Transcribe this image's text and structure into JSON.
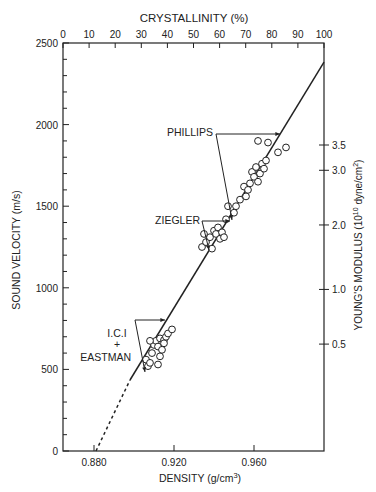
{
  "chart_data": {
    "type": "scatter",
    "title": "",
    "top_axis": {
      "label": "CRYSTALLINITY (%)",
      "ticks": [
        0,
        10,
        20,
        30,
        40,
        50,
        60,
        70,
        80,
        90,
        100
      ],
      "range": [
        0,
        100
      ]
    },
    "xlabel": "DENSITY (g/cm3)",
    "xlabel_main": "DENSITY (g/cm",
    "xlabel_sup": "3",
    "xlabel_end": ")",
    "xticks": [
      "0.880",
      "0.920",
      "0.960"
    ],
    "xlim": [
      0.8645,
      0.995
    ],
    "ylabel": "SOUND VELOCITY (m/s)",
    "yticks": [
      "0",
      "500",
      "1000",
      "1500",
      "2000",
      "2500"
    ],
    "ylim": [
      0,
      2500
    ],
    "right_axis": {
      "label": "YOUNG'S MODULUS (10^10 dyne/cm2)",
      "label_pre": "YOUNG'S MODULUS (10",
      "label_sup1": "10",
      "label_mid": " dyne/cm",
      "label_sup2": "2",
      "label_end": ")",
      "ticks": [
        {
          "label": "0.5",
          "velocity": 655
        },
        {
          "label": "1.0",
          "velocity": 990
        },
        {
          "label": "2.0",
          "velocity": 1385
        },
        {
          "label": "3.0",
          "velocity": 1720
        },
        {
          "label": "3.5",
          "velocity": 1875
        }
      ]
    },
    "grid": false,
    "fit_line": {
      "dashed": [
        [
          0.881,
          0
        ],
        [
          0.898,
          435
        ]
      ],
      "solid": [
        [
          0.898,
          435
        ],
        [
          0.995,
          2383
        ]
      ]
    },
    "series": [
      {
        "name": "I.C.I + EASTMAN",
        "points": [
          [
            0.906,
            560
          ],
          [
            0.907,
            520
          ],
          [
            0.908,
            540
          ],
          [
            0.909,
            600
          ],
          [
            0.91,
            650
          ],
          [
            0.911,
            675
          ],
          [
            0.912,
            640
          ],
          [
            0.913,
            690
          ],
          [
            0.913,
            580
          ],
          [
            0.914,
            620
          ],
          [
            0.915,
            680
          ],
          [
            0.915,
            660
          ],
          [
            0.916,
            700
          ],
          [
            0.917,
            720
          ],
          [
            0.919,
            745
          ],
          [
            0.912,
            530
          ],
          [
            0.908,
            675
          ]
        ]
      },
      {
        "name": "ZIEGLER",
        "points": [
          [
            0.934,
            1250
          ],
          [
            0.936,
            1280
          ],
          [
            0.938,
            1310
          ],
          [
            0.939,
            1240
          ],
          [
            0.94,
            1350
          ],
          [
            0.941,
            1330
          ],
          [
            0.942,
            1370
          ],
          [
            0.943,
            1300
          ],
          [
            0.944,
            1340
          ],
          [
            0.945,
            1310
          ],
          [
            0.946,
            1420
          ],
          [
            0.935,
            1330
          ]
        ]
      },
      {
        "name": "PHILLIPS",
        "points": [
          [
            0.95,
            1460
          ],
          [
            0.951,
            1500
          ],
          [
            0.953,
            1540
          ],
          [
            0.955,
            1620
          ],
          [
            0.956,
            1560
          ],
          [
            0.957,
            1600
          ],
          [
            0.958,
            1640
          ],
          [
            0.959,
            1710
          ],
          [
            0.96,
            1680
          ],
          [
            0.961,
            1740
          ],
          [
            0.962,
            1650
          ],
          [
            0.963,
            1700
          ],
          [
            0.964,
            1760
          ],
          [
            0.965,
            1730
          ],
          [
            0.966,
            1780
          ],
          [
            0.962,
            1900
          ],
          [
            0.967,
            1890
          ],
          [
            0.972,
            1830
          ],
          [
            0.976,
            1860
          ],
          [
            0.947,
            1500
          ]
        ]
      }
    ],
    "annotations": [
      {
        "text": "PHILLIPS",
        "x": 0.937,
        "y": 1950
      },
      {
        "text": "ZIEGLER",
        "x": 0.921,
        "y": 1410
      },
      {
        "text": "I.C.I",
        "text2": "+",
        "text3": "EASTMAN",
        "x": 0.893,
        "y": 700
      }
    ]
  },
  "labels": {
    "top_title": "CRYSTALLINITY (%)",
    "phillips": "PHILLIPS",
    "ziegler": "ZIEGLER",
    "ici": "I.C.I",
    "plus": "+",
    "eastman": "EASTMAN"
  }
}
